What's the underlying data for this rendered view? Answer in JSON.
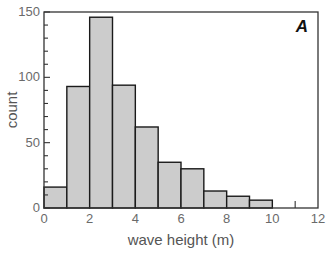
{
  "chart_data": {
    "type": "bar",
    "subtype": "histogram",
    "panel_label": "A",
    "title": "",
    "xlabel": "wave height (m)",
    "ylabel": "count",
    "xlim": [
      0,
      12
    ],
    "ylim": [
      0,
      150
    ],
    "xticks": [
      0,
      2,
      4,
      6,
      8,
      10,
      12
    ],
    "yticks": [
      0,
      50,
      100,
      150
    ],
    "y_minor_tick_step": 10,
    "grid": false,
    "legend": null,
    "bins": [
      {
        "x0": 0,
        "x1": 1,
        "count": 16
      },
      {
        "x0": 1,
        "x1": 2,
        "count": 93
      },
      {
        "x0": 2,
        "x1": 3,
        "count": 146
      },
      {
        "x0": 3,
        "x1": 4,
        "count": 94
      },
      {
        "x0": 4,
        "x1": 5,
        "count": 62
      },
      {
        "x0": 5,
        "x1": 6,
        "count": 35
      },
      {
        "x0": 6,
        "x1": 7,
        "count": 30
      },
      {
        "x0": 7,
        "x1": 8,
        "count": 13
      },
      {
        "x0": 8,
        "x1": 9,
        "count": 9
      },
      {
        "x0": 9,
        "x1": 10,
        "count": 6
      },
      {
        "x0": 10,
        "x1": 11,
        "count": 0
      }
    ],
    "extra_x_tick_marks": [
      11
    ],
    "categories": [
      "0-1",
      "1-2",
      "2-3",
      "3-4",
      "4-5",
      "5-6",
      "6-7",
      "7-8",
      "8-9",
      "9-10",
      "10-11"
    ],
    "values": [
      16,
      93,
      146,
      94,
      62,
      35,
      30,
      13,
      9,
      6,
      0
    ]
  },
  "colors": {
    "bar_fill": "#cccccc",
    "bar_edge": "#1a1a1a",
    "axis": "#333333",
    "tick_text": "#6a6a6a",
    "label_text": "#555555"
  }
}
